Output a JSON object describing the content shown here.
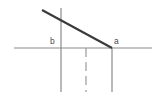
{
  "diagram": {
    "background_color": "#ffffff",
    "width": 167,
    "height": 101,
    "labels": [
      {
        "id": "b",
        "text": "b",
        "x": 50,
        "y": 37,
        "color": "#4a4a4a"
      },
      {
        "id": "a",
        "text": "a",
        "x": 114,
        "y": 37,
        "color": "#4a4a4a"
      }
    ],
    "axis": {
      "name": "horizontal-axis",
      "x1": 14,
      "y1": 48,
      "x2": 152,
      "y2": 48,
      "color": "#8a8a8a"
    },
    "vertical_lines": [
      {
        "id": "vertical-line-b",
        "style": "solid",
        "x": 61,
        "y_top": 8,
        "y_bottom": 92,
        "color": "#8a8a8a"
      },
      {
        "id": "vertical-line-middle",
        "style": "dashed",
        "x": 86,
        "y_top": 48,
        "y_bottom": 92,
        "color": "#9a9a9a"
      },
      {
        "id": "vertical-line-a",
        "style": "solid",
        "x": 112,
        "y_top": 48,
        "y_bottom": 92,
        "color": "#8a8a8a"
      }
    ],
    "diagonal": {
      "id": "diagonal-segment",
      "x1": 42,
      "y1": 10,
      "x2": 112,
      "y2": 48,
      "color": "#3a3a3a"
    }
  }
}
